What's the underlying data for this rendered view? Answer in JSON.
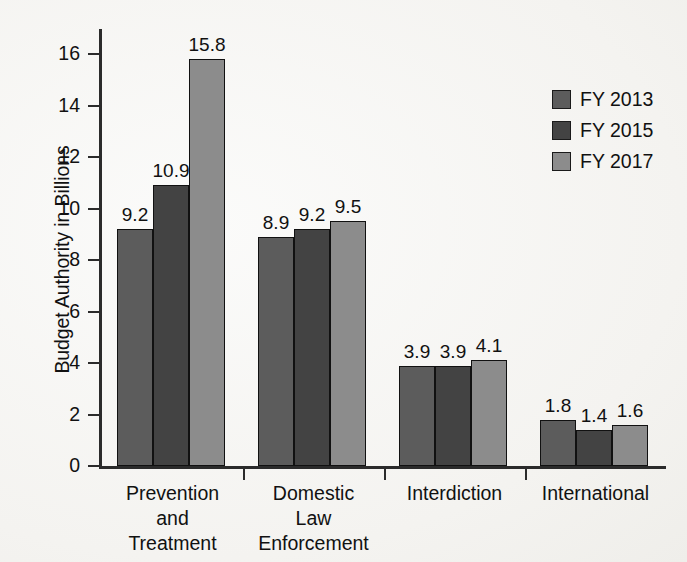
{
  "chart_data": {
    "type": "bar",
    "title": "",
    "subtitle": "",
    "xlabel": "",
    "ylabel": "Budget Authority in Billions",
    "categories": [
      "Prevention and Treatment",
      "Domestic Law Enforcement",
      "Interdiction",
      "International"
    ],
    "category_lines": [
      [
        "Prevention",
        "and",
        "Treatment"
      ],
      [
        "Domestic",
        "Law",
        "Enforcement"
      ],
      [
        "Interdiction"
      ],
      [
        "International"
      ]
    ],
    "series": [
      {
        "name": "FY 2013",
        "color": "#5c5c5c",
        "values": [
          9.2,
          8.9,
          3.9,
          1.8
        ]
      },
      {
        "name": "FY 2015",
        "color": "#434343",
        "values": [
          10.9,
          9.2,
          3.9,
          1.4
        ]
      },
      {
        "name": "FY 2017",
        "color": "#8c8c8c",
        "values": [
          15.8,
          9.5,
          4.1,
          1.6
        ]
      }
    ],
    "value_labels": [
      [
        "9.2",
        "10.9",
        "15.8"
      ],
      [
        "8.9",
        "9.2",
        "9.5"
      ],
      [
        "3.9",
        "3.9",
        "4.1"
      ],
      [
        "1.8",
        "1.4",
        "1.6"
      ]
    ],
    "ylim": [
      0,
      17
    ],
    "yticks": [
      0,
      2,
      4,
      6,
      8,
      10,
      12,
      14,
      16
    ],
    "ytick_labels": [
      "0",
      "2",
      "4",
      "6",
      "8",
      "10",
      "12",
      "14",
      "16"
    ],
    "grid": false,
    "legend_position": "right",
    "value_labels_shown": true,
    "axis_color": "#2b2b2b",
    "background_color": "#f7f6f4"
  },
  "legend": {
    "entries": [
      {
        "label": "FY 2013",
        "color": "#5c5c5c"
      },
      {
        "label": "FY 2015",
        "color": "#434343"
      },
      {
        "label": "FY 2017",
        "color": "#8c8c8c"
      }
    ]
  }
}
